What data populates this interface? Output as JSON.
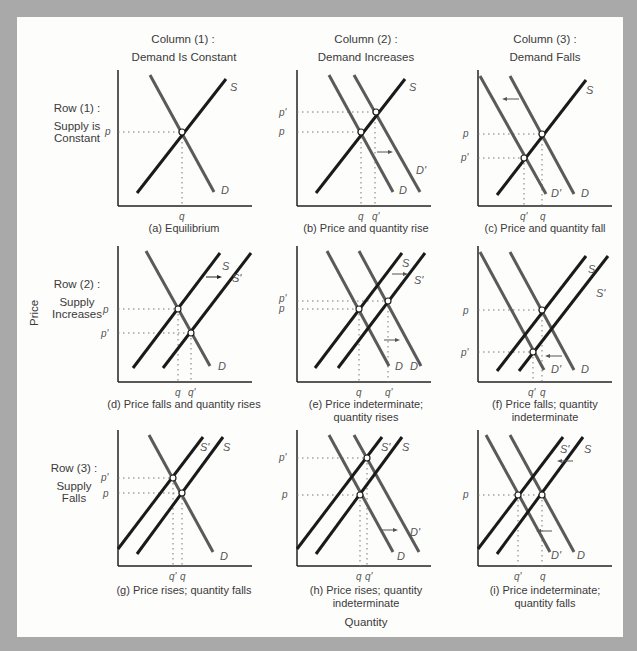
{
  "axes": {
    "y_label": "Price",
    "x_label": "Quantity"
  },
  "columns": [
    {
      "title": "Column (1) :",
      "subtitle": "Demand Is Constant"
    },
    {
      "title": "Column (2) :",
      "subtitle": "Demand Increases"
    },
    {
      "title": "Column (3) :",
      "subtitle": "Demand Falls"
    }
  ],
  "rows": [
    {
      "title": "Row  (1) :",
      "line1": "Supply is",
      "line2": "Constant"
    },
    {
      "title": "Row  (2) :",
      "line1": "Supply",
      "line2": "Increases"
    },
    {
      "title": "Row  (3) :",
      "line1": "Supply",
      "line2": "Falls"
    }
  ],
  "colors": {
    "frame": "#a9a9a9",
    "background": "#fdfdfc",
    "supply": "#1a1a1a",
    "demand": "#5a5a5a",
    "guides": "#777777"
  },
  "panels": [
    {
      "id": "a",
      "caption1": "(a) Equilibrium",
      "caption2": "",
      "price_labels": [
        "p"
      ],
      "qty_labels": [
        "q"
      ],
      "curves": [
        "S",
        "D"
      ]
    },
    {
      "id": "b",
      "caption1": "(b) Price and quantity rise",
      "caption2": "",
      "price_labels": [
        "p'",
        "p"
      ],
      "qty_labels": [
        "q",
        "q'"
      ],
      "curves": [
        "S",
        "D",
        "D'"
      ]
    },
    {
      "id": "c",
      "caption1": "(c) Price and quantity fall",
      "caption2": "",
      "price_labels": [
        "p",
        "p'"
      ],
      "qty_labels": [
        "q'",
        "q"
      ],
      "curves": [
        "S",
        "D'",
        "D"
      ]
    },
    {
      "id": "d",
      "caption1": "(d) Price falls and quantity rises",
      "caption2": "",
      "price_labels": [
        "p",
        "p'"
      ],
      "qty_labels": [
        "q",
        "q'"
      ],
      "curves": [
        "S",
        "S'",
        "D"
      ]
    },
    {
      "id": "e",
      "caption1": "(e) Price indeterminate;",
      "caption2": "quantity rises",
      "price_labels": [
        "p'",
        "p"
      ],
      "qty_labels": [
        "q",
        "q'"
      ],
      "curves": [
        "S",
        "S'",
        "D",
        "D'"
      ]
    },
    {
      "id": "f",
      "caption1": "(f) Price falls; quantity",
      "caption2": "indeterminate",
      "price_labels": [
        "p",
        "p'"
      ],
      "qty_labels": [
        "q'",
        "q"
      ],
      "curves": [
        "S",
        "S'",
        "D'",
        "D"
      ]
    },
    {
      "id": "g",
      "caption1": "(g) Price rises; quantity falls",
      "caption2": "",
      "price_labels": [
        "p'",
        "p"
      ],
      "qty_labels": [
        "q'",
        "q"
      ],
      "curves": [
        "S'",
        "S",
        "D"
      ]
    },
    {
      "id": "h",
      "caption1": "(h) Price rises; quantity",
      "caption2": "indeterminate",
      "price_labels": [
        "p'",
        "p"
      ],
      "qty_labels": [
        "q",
        "q'"
      ],
      "curves": [
        "S'",
        "S",
        "D",
        "D'"
      ]
    },
    {
      "id": "i",
      "caption1": "(i) Price indeterminate;",
      "caption2": "quantity falls",
      "price_labels": [
        "p"
      ],
      "qty_labels": [
        "q'",
        "q"
      ],
      "curves": [
        "S'",
        "S",
        "D'",
        "D"
      ]
    }
  ]
}
